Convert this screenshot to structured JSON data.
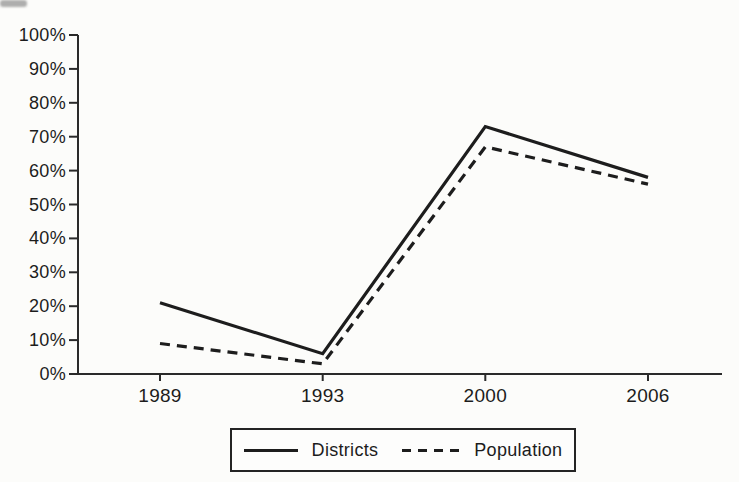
{
  "chart_data": {
    "type": "line",
    "title": "",
    "xlabel": "",
    "ylabel": "",
    "categories": [
      "1989",
      "1993",
      "2000",
      "2006"
    ],
    "series": [
      {
        "name": "Districts",
        "style": "solid",
        "values": [
          21,
          6,
          73,
          58
        ]
      },
      {
        "name": "Population",
        "style": "dashed",
        "values": [
          9,
          3,
          67,
          56
        ]
      }
    ],
    "ylim": [
      0,
      100
    ],
    "y_tick_step": 10,
    "y_tick_labels": [
      "0%",
      "10%",
      "20%",
      "30%",
      "40%",
      "50%",
      "60%",
      "70%",
      "80%",
      "90%",
      "100%"
    ],
    "grid": false,
    "legend_position": "bottom-center"
  },
  "colors": {
    "line": "#1d1d1d",
    "axis": "#2a2a2a",
    "text": "#1c1c1c",
    "background": "#fcfcfa"
  }
}
